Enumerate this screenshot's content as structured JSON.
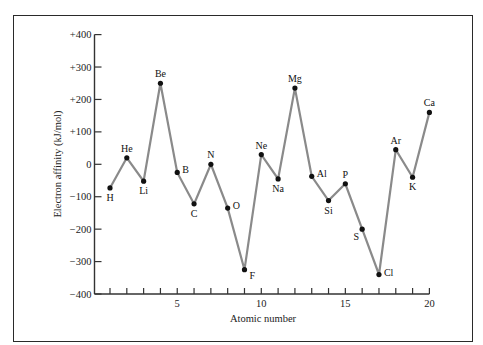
{
  "chart_data": {
    "type": "line",
    "title": "",
    "xlabel": "Atomic number",
    "ylabel": "Electron affinity (kJ/mol)",
    "xlim": [
      0,
      20
    ],
    "ylim": [
      -400,
      400
    ],
    "x_ticks": [
      1,
      2,
      3,
      4,
      5,
      6,
      7,
      8,
      9,
      10,
      11,
      12,
      13,
      14,
      15,
      16,
      17,
      18,
      19,
      20
    ],
    "x_tick_labels": [
      {
        "value": 5,
        "label": "5"
      },
      {
        "value": 10,
        "label": "10"
      },
      {
        "value": 15,
        "label": "15"
      },
      {
        "value": 20,
        "label": "20"
      }
    ],
    "y_ticks": [
      {
        "value": 400,
        "label": "+400"
      },
      {
        "value": 300,
        "label": "+300"
      },
      {
        "value": 200,
        "label": "+200"
      },
      {
        "value": 100,
        "label": "+100"
      },
      {
        "value": 0,
        "label": "0"
      },
      {
        "value": -100,
        "label": "−100"
      },
      {
        "value": -200,
        "label": "−200"
      },
      {
        "value": -300,
        "label": "−300"
      },
      {
        "value": -400,
        "label": "−400"
      }
    ],
    "grid": false,
    "legend": null,
    "series": [
      {
        "name": "Electron affinity",
        "points": [
          {
            "x": 1,
            "y": -73,
            "label": "H",
            "label_pos": "below"
          },
          {
            "x": 2,
            "y": 20,
            "label": "He",
            "label_pos": "above"
          },
          {
            "x": 3,
            "y": -52,
            "label": "Li",
            "label_pos": "below"
          },
          {
            "x": 4,
            "y": 250,
            "label": "Be",
            "label_pos": "above"
          },
          {
            "x": 5,
            "y": -25,
            "label": "B",
            "label_pos": "right"
          },
          {
            "x": 6,
            "y": -122,
            "label": "C",
            "label_pos": "below"
          },
          {
            "x": 7,
            "y": 0,
            "label": "N",
            "label_pos": "above"
          },
          {
            "x": 8,
            "y": -135,
            "label": "O",
            "label_pos": "right"
          },
          {
            "x": 9,
            "y": -325,
            "label": "F",
            "label_pos": "right-below"
          },
          {
            "x": 10,
            "y": 30,
            "label": "Ne",
            "label_pos": "above"
          },
          {
            "x": 11,
            "y": -45,
            "label": "Na",
            "label_pos": "below"
          },
          {
            "x": 12,
            "y": 235,
            "label": "Mg",
            "label_pos": "above"
          },
          {
            "x": 13,
            "y": -37,
            "label": "Al",
            "label_pos": "right"
          },
          {
            "x": 14,
            "y": -112,
            "label": "Si",
            "label_pos": "below"
          },
          {
            "x": 15,
            "y": -60,
            "label": "P",
            "label_pos": "above"
          },
          {
            "x": 16,
            "y": -200,
            "label": "S",
            "label_pos": "left-below"
          },
          {
            "x": 17,
            "y": -340,
            "label": "Cl",
            "label_pos": "right"
          },
          {
            "x": 18,
            "y": 45,
            "label": "Ar",
            "label_pos": "above"
          },
          {
            "x": 19,
            "y": -40,
            "label": "K",
            "label_pos": "below"
          },
          {
            "x": 20,
            "y": 160,
            "label": "Ca",
            "label_pos": "above"
          }
        ]
      }
    ]
  },
  "colors": {
    "line": "#8a8a8a",
    "marker": "#111111",
    "axis": "#333333",
    "frame": "#2a2a2a",
    "text": "#222222"
  }
}
